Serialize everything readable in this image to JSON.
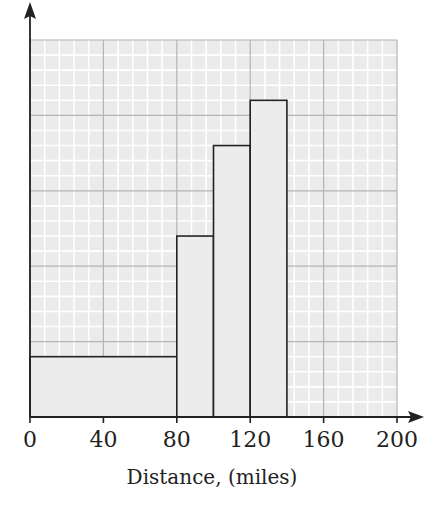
{
  "chart_data": {
    "type": "bar",
    "subtype": "histogram",
    "title": "",
    "xlabel": "Distance, (miles)",
    "ylabel": "",
    "xlim": [
      0,
      200
    ],
    "x_ticks": [
      0,
      40,
      80,
      120,
      160,
      200
    ],
    "x_tick_labels": [
      "0",
      "40",
      "80",
      "120",
      "160",
      "200"
    ],
    "y_ticks_labeled": false,
    "y_unit_note": "Bar heights given in small grid squares (5 small squares per large square); no y-axis scale shown",
    "grid": {
      "on": true,
      "major_x_step": 40,
      "minor_per_major": 5,
      "major_y_count": 5
    },
    "bins": [
      {
        "from": 0,
        "to": 80,
        "height": 4
      },
      {
        "from": 80,
        "to": 100,
        "height": 12
      },
      {
        "from": 100,
        "to": 120,
        "height": 18
      },
      {
        "from": 120,
        "to": 140,
        "height": 21
      }
    ],
    "categories": [
      "0-80",
      "80-100",
      "100-120",
      "120-140"
    ],
    "values": [
      4,
      12,
      18,
      21
    ],
    "ylim": [
      0,
      25
    ],
    "legend": null
  },
  "colors": {
    "grid_background": "#ebebeb",
    "minor_grid": "#ffffff",
    "major_grid": "#b4b4b4",
    "bar_fill": "#ececec",
    "bar_stroke": "#222222",
    "axis": "#222222"
  }
}
